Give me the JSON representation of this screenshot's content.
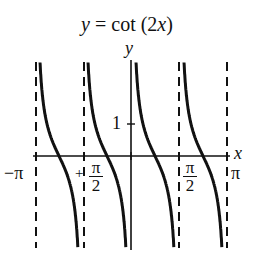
{
  "header_fragment": "2x − π/2, (− −, −)",
  "chart_data": {
    "type": "line",
    "title": "y = cot (2x)",
    "function": "cot(2x)",
    "xlabel": "x",
    "ylabel": "y",
    "xlim": [
      -3.14159,
      3.14159
    ],
    "ylim": [
      -2.9,
      2.9
    ],
    "x_tick_labels": [
      "−π",
      "−π/2",
      "π/2",
      "π"
    ],
    "y_tick_labels": [
      "1"
    ],
    "asymptotes": [
      "-π",
      "-π/2",
      "0",
      "π/2",
      "π"
    ],
    "branches": 4,
    "grid": false,
    "legend": "none",
    "line_color": "#111111",
    "asymptote_style": "dashed"
  },
  "labels": {
    "title_y": "y",
    "title_eq": " = cot (2",
    "title_x": "x",
    "title_close": ")",
    "axis_y": "y",
    "axis_x": "x",
    "neg_pi": "−π",
    "pi": "π",
    "neg_sign": "+",
    "pi_num": "π",
    "two": "2",
    "one": "1"
  }
}
